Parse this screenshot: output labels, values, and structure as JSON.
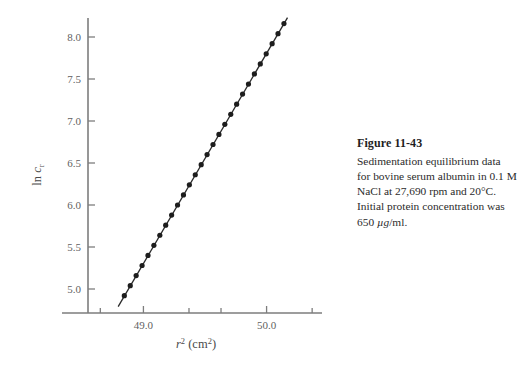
{
  "figure": {
    "caption_title": "Figure 11-43",
    "caption_lines": [
      "Sedimentation equilibrium data",
      "for bovine serum albumin in 0.1 M",
      "NaCl at 27,690 rpm and 20°C.",
      "Initial protein concentration was",
      "650 µg/ml."
    ]
  },
  "chart_data": {
    "type": "scatter",
    "title": "",
    "subtitle": "",
    "xlabel": "r² (cm²)",
    "xlabel_parts": {
      "var": "r",
      "var_sup": "2",
      "unit": "cm",
      "unit_sup": "2"
    },
    "ylabel": "ln cᵣ",
    "ylabel_parts": {
      "fn": "ln ",
      "var": "c",
      "var_sub": "r"
    },
    "xlim": [
      48.55,
      50.45
    ],
    "ylim": [
      4.72,
      8.25
    ],
    "xticks_major": [
      49.0,
      50.0
    ],
    "xticks_major_labels": [
      "49.0",
      "50.0"
    ],
    "xticks_minor": [
      48.65,
      49.37,
      49.63,
      50.37
    ],
    "yticks": [
      5.0,
      5.5,
      6.0,
      6.5,
      7.0,
      7.5,
      8.0
    ],
    "ytick_labels": [
      "5.0",
      "5.5",
      "6.0",
      "6.5",
      "7.0",
      "7.5",
      "8.0"
    ],
    "grid": false,
    "legend": "none",
    "marker": "filled-circle",
    "marker_color": "#1d1d1d",
    "line_color": "#2a2a2a",
    "axis_color": "#7d7d7d",
    "fit_line": {
      "x_start": 48.795,
      "y_start": 4.79,
      "x_end": 50.17,
      "y_end": 8.23
    },
    "x": [
      48.845,
      48.893,
      48.941,
      48.989,
      49.037,
      49.085,
      49.133,
      49.181,
      49.229,
      49.277,
      49.325,
      49.373,
      49.421,
      49.469,
      49.517,
      49.565,
      49.613,
      49.661,
      49.709,
      49.757,
      49.805,
      49.853,
      49.901,
      49.949,
      49.997,
      50.045,
      50.093,
      50.141
    ],
    "y": [
      4.92,
      5.04,
      5.16,
      5.28,
      5.4,
      5.52,
      5.64,
      5.76,
      5.88,
      6.0,
      6.12,
      6.24,
      6.36,
      6.48,
      6.6,
      6.72,
      6.84,
      6.96,
      7.08,
      7.2,
      7.32,
      7.44,
      7.56,
      7.68,
      7.8,
      7.92,
      8.04,
      8.16
    ]
  }
}
